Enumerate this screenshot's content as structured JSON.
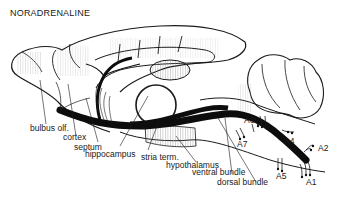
{
  "title": "NORADRENALINE",
  "labels": {
    "bulbus_olf": "bulbus olf.",
    "cortex": "cortex",
    "septum": "septum",
    "hippocampus": "hippocampus",
    "stria_term": "stria term.",
    "hypothalamus": "hypothalamus",
    "ventral_bundle": "ventral bundle",
    "dorsal_bundle": "dorsal bundle",
    "a1": "A1",
    "a2": "A2",
    "a4": "A4",
    "a5": "A5",
    "a6": "A6",
    "a7": "A7"
  },
  "colors": {
    "ink": "#1a1a1a",
    "hatch": "#9a9a9a",
    "background": "#ffffff"
  }
}
